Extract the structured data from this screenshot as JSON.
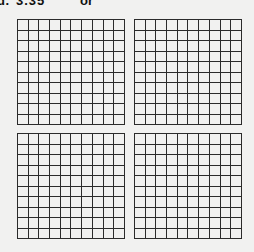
{
  "problem": {
    "label": "d.",
    "value": "3.35",
    "connector": "or",
    "answer": ""
  },
  "colors": {
    "background": "#f1f1f0",
    "grid_line": "#2b2b2b",
    "answer_box": "#c6c6c6"
  },
  "grids": [
    {
      "id": "grid-0",
      "rows": 10,
      "cols": 10,
      "shaded": 0
    },
    {
      "id": "grid-1",
      "rows": 10,
      "cols": 10,
      "shaded": 0
    },
    {
      "id": "grid-2",
      "rows": 10,
      "cols": 10,
      "shaded": 0
    },
    {
      "id": "grid-3",
      "rows": 10,
      "cols": 10,
      "shaded": 0
    }
  ]
}
